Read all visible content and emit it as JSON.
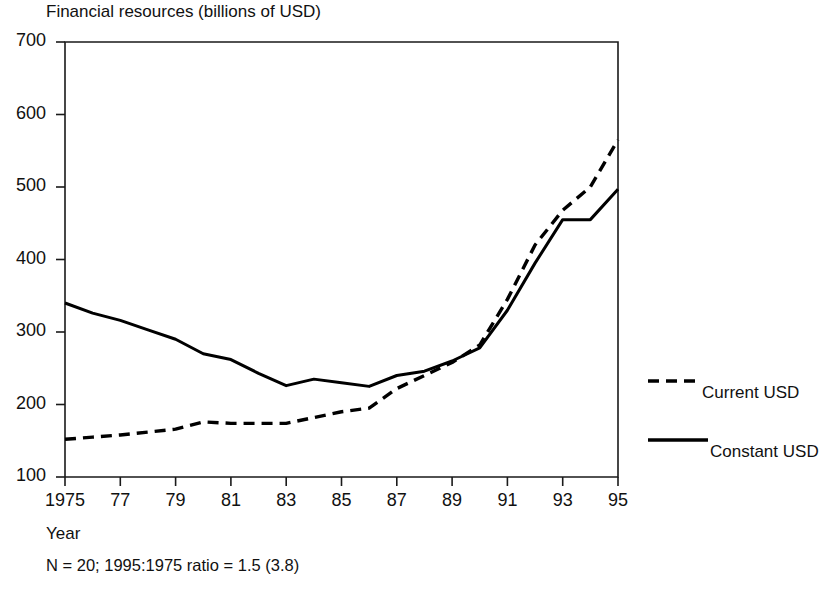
{
  "chart_data": {
    "type": "line",
    "title": "Financial resources (billions of USD)",
    "xlabel": "Year",
    "ylabel": "",
    "footnote": "N = 20; 1995:1975 ratio = 1.5 (3.8)",
    "grid": false,
    "legend_position": "right",
    "xlim": [
      1975,
      1995
    ],
    "ylim": [
      100,
      700
    ],
    "ytick_labels": [
      "700",
      "600",
      "500",
      "400",
      "300",
      "200",
      "100"
    ],
    "ytick_values": [
      700,
      600,
      500,
      400,
      300,
      200,
      100
    ],
    "xtick_labels": [
      "1975",
      "77",
      "79",
      "81",
      "83",
      "85",
      "87",
      "89",
      "91",
      "93",
      "95"
    ],
    "xtick_values": [
      1975,
      1977,
      1979,
      1981,
      1983,
      1985,
      1987,
      1989,
      1991,
      1993,
      1995
    ],
    "x": [
      1975,
      1976,
      1977,
      1978,
      1979,
      1980,
      1981,
      1982,
      1983,
      1984,
      1985,
      1986,
      1987,
      1988,
      1989,
      1990,
      1991,
      1992,
      1993,
      1994,
      1995
    ],
    "series": [
      {
        "name": "Current USD",
        "style": "dashed",
        "color": "#000000",
        "values": [
          152,
          155,
          158,
          162,
          166,
          176,
          174,
          174,
          174,
          182,
          190,
          195,
          222,
          240,
          258,
          282,
          345,
          420,
          468,
          500,
          565
        ]
      },
      {
        "name": "Constant USD",
        "style": "solid",
        "color": "#000000",
        "values": [
          340,
          326,
          316,
          303,
          290,
          270,
          262,
          243,
          226,
          235,
          230,
          225,
          240,
          246,
          260,
          278,
          330,
          395,
          455,
          455,
          497
        ]
      }
    ]
  },
  "legend": {
    "items": [
      {
        "label": "Current USD",
        "style": "dashed"
      },
      {
        "label": "Constant USD",
        "style": "solid"
      }
    ]
  }
}
